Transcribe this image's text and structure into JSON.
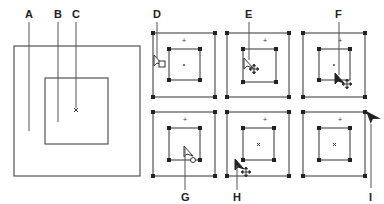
{
  "diagram": {
    "main_figure": {
      "labels": {
        "A": "A",
        "B": "B",
        "C": "C"
      }
    },
    "panels": [
      {
        "id": "D",
        "label": "D",
        "cursor": "hollow-arrow-with-square"
      },
      {
        "id": "E",
        "label": "E",
        "cursor": "hollow-arrow-with-move"
      },
      {
        "id": "F",
        "label": "F",
        "cursor": "solid-arrow-with-move"
      },
      {
        "id": "G",
        "label": "G",
        "cursor": "hollow-arrow-with-circle"
      },
      {
        "id": "H",
        "label": "H",
        "cursor": "solid-arrow-with-move"
      },
      {
        "id": "I",
        "label": "I",
        "cursor": "solid-arrow"
      }
    ],
    "colors": {
      "stroke": "#333333",
      "background": "#ffffff"
    }
  }
}
